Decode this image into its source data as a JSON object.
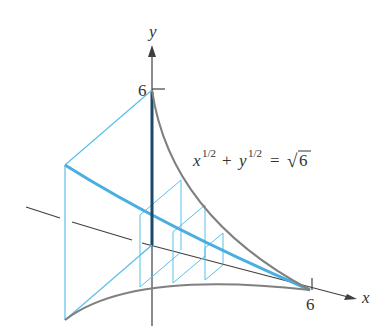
{
  "figure": {
    "axes": {
      "x_label": "x",
      "y_label": "y",
      "x_tick_label": "6",
      "y_tick_label": "6"
    },
    "equation": {
      "x_base": "x",
      "x_exp": "1/2",
      "plus": "+",
      "y_base": "y",
      "y_exp": "1/2",
      "equals": "=",
      "sqrt_symbol": "√",
      "radicand": "6"
    },
    "colors": {
      "curve": "#808080",
      "axis": "#404040",
      "cross_section": "#5bbfe8",
      "highlight": "#4aaee0",
      "edge_dark": "#1a4a6a"
    }
  }
}
